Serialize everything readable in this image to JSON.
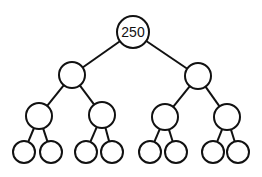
{
  "diagram": {
    "type": "binary-tree",
    "colors": {
      "stroke": "#111111",
      "fill": "#ffffff"
    },
    "root": {
      "label": "250"
    },
    "nodes": [
      {
        "id": "n0",
        "label": "250",
        "cx": 133,
        "cy": 32,
        "r": 16
      },
      {
        "id": "n1",
        "label": "",
        "cx": 72,
        "cy": 75,
        "r": 13
      },
      {
        "id": "n2",
        "label": "",
        "cx": 198,
        "cy": 76,
        "r": 13
      },
      {
        "id": "n3",
        "label": "",
        "cx": 39,
        "cy": 116,
        "r": 13
      },
      {
        "id": "n4",
        "label": "",
        "cx": 102,
        "cy": 115,
        "r": 13
      },
      {
        "id": "n5",
        "label": "",
        "cx": 165,
        "cy": 117,
        "r": 13
      },
      {
        "id": "n6",
        "label": "",
        "cx": 227,
        "cy": 117,
        "r": 13
      },
      {
        "id": "n7",
        "label": "",
        "cx": 24,
        "cy": 152,
        "r": 11
      },
      {
        "id": "n8",
        "label": "",
        "cx": 51,
        "cy": 152,
        "r": 11
      },
      {
        "id": "n9",
        "label": "",
        "cx": 86,
        "cy": 152,
        "r": 11
      },
      {
        "id": "n10",
        "label": "",
        "cx": 112,
        "cy": 152,
        "r": 11
      },
      {
        "id": "n11",
        "label": "",
        "cx": 150,
        "cy": 152,
        "r": 11
      },
      {
        "id": "n12",
        "label": "",
        "cx": 176,
        "cy": 152,
        "r": 11
      },
      {
        "id": "n13",
        "label": "",
        "cx": 213,
        "cy": 152,
        "r": 11
      },
      {
        "id": "n14",
        "label": "",
        "cx": 238,
        "cy": 152,
        "r": 11
      }
    ],
    "edges": [
      [
        "n0",
        "n1"
      ],
      [
        "n0",
        "n2"
      ],
      [
        "n1",
        "n3"
      ],
      [
        "n1",
        "n4"
      ],
      [
        "n2",
        "n5"
      ],
      [
        "n2",
        "n6"
      ],
      [
        "n3",
        "n7"
      ],
      [
        "n3",
        "n8"
      ],
      [
        "n4",
        "n9"
      ],
      [
        "n4",
        "n10"
      ],
      [
        "n5",
        "n11"
      ],
      [
        "n5",
        "n12"
      ],
      [
        "n6",
        "n13"
      ],
      [
        "n6",
        "n14"
      ]
    ]
  }
}
